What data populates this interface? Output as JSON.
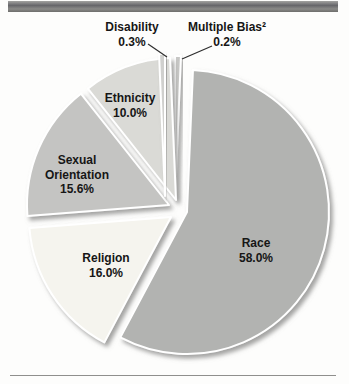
{
  "page": {
    "background": "#fdfdfc",
    "top_bar_color": "#6f6f6d",
    "bottom_rule_color": "#8f8f8d"
  },
  "chart_data": {
    "type": "pie",
    "title": "",
    "start_angle": "top",
    "direction": "clockwise",
    "legend": "none (labels on or near slices)",
    "style": "exploded, beveled grayscale slices with white gaps and drop shadows",
    "slices": [
      {
        "id": "multiple-bias",
        "label": "Multiple Bias²",
        "value": 0.2,
        "color": "#c7c7c5",
        "explode": [
          -6,
          -12
        ]
      },
      {
        "id": "race",
        "label": "Race",
        "value": 58.0,
        "color": "#b2b3b1",
        "explode": [
          6,
          2
        ]
      },
      {
        "id": "religion",
        "label": "Religion",
        "value": 16.0,
        "color": "#f5f4ee",
        "explode": [
          -10,
          7
        ]
      },
      {
        "id": "sexual-orientation",
        "label": "Sexual Orientation",
        "value": 15.6,
        "color": "#c4c4c2",
        "explode": [
          -12,
          -5
        ]
      },
      {
        "id": "ethnicity",
        "label": "Ethnicity",
        "value": 10.0,
        "color": "#dadad6",
        "explode": [
          -5,
          -10
        ]
      },
      {
        "id": "disability",
        "label": "Disability",
        "value": 0.3,
        "color": "#d0d0ce",
        "explode": [
          -16,
          -14
        ]
      }
    ],
    "labels": {
      "disability": {
        "line1": "Disability",
        "line2": "0.3%"
      },
      "multiple_bias": {
        "line1": "Multiple Bias²",
        "line2": "0.2%"
      },
      "ethnicity": {
        "line1": "Ethnicity",
        "line2": "10.0%"
      },
      "sexual_orientation": {
        "line1": "Sexual",
        "line2": "Orientation",
        "line3": "15.6%"
      },
      "religion": {
        "line1": "Religion",
        "line2": "16.0%"
      },
      "race": {
        "line1": "Race",
        "line2": "58.0%"
      }
    }
  }
}
